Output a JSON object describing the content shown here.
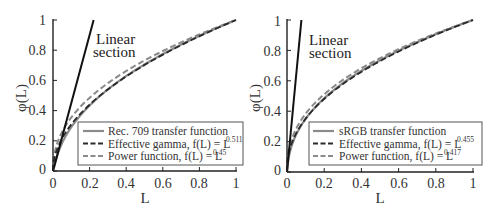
{
  "chart_data": [
    {
      "type": "line",
      "title": "",
      "xlabel": "L",
      "ylabel": "φ(L)",
      "xlim": [
        0,
        1
      ],
      "ylim": [
        0,
        1
      ],
      "xticks": [
        "0",
        "0.2",
        "0.4",
        "0.6",
        "0.8",
        "1"
      ],
      "yticks": [
        "0",
        "0.2",
        "0.4",
        "0.6",
        "0.8",
        "1"
      ],
      "grid": false,
      "legend_position": "lower right",
      "annotation": [
        "Linear",
        "section"
      ],
      "linear_section": {
        "slope": 4.5,
        "x": [
          0,
          0.222
        ],
        "y": [
          0,
          1
        ]
      },
      "series": [
        {
          "name": "Rec. 709 transfer function",
          "style": "solid",
          "color": "#8a8a8a",
          "formula": "L<0.018 ? 4.5L : 1.099*L^0.45 - 0.099",
          "x": [
            0,
            0.018,
            0.05,
            0.1,
            0.2,
            0.3,
            0.4,
            0.5,
            0.6,
            0.7,
            0.8,
            0.9,
            1.0
          ],
          "y": [
            0,
            0.081,
            0.226,
            0.409,
            0.591,
            0.706,
            0.795,
            0.869,
            0.934,
            0.991,
            1.043,
            0.978,
            1.0
          ]
        },
        {
          "name": "Effective gamma, f(L) = L^0.511",
          "label_main": "Effective gamma, f(L) = L",
          "exponent": "0.511",
          "style": "dashed",
          "color": "#222222",
          "x": [
            0,
            0.05,
            0.1,
            0.2,
            0.3,
            0.4,
            0.5,
            0.6,
            0.7,
            0.8,
            0.9,
            1.0
          ],
          "y": [
            0,
            0.216,
            0.308,
            0.44,
            0.54,
            0.626,
            0.702,
            0.77,
            0.833,
            0.892,
            0.948,
            1.0
          ]
        },
        {
          "name": "Power function, f(L) = L^0.45",
          "label_main": "Power function, f(L) = L",
          "exponent": "0.45",
          "style": "dashed",
          "color": "#8a8a8a",
          "x": [
            0,
            0.05,
            0.1,
            0.2,
            0.3,
            0.4,
            0.5,
            0.6,
            0.7,
            0.8,
            0.9,
            1.0
          ],
          "y": [
            0,
            0.26,
            0.355,
            0.485,
            0.582,
            0.662,
            0.732,
            0.795,
            0.852,
            0.904,
            0.954,
            1.0
          ]
        }
      ],
      "legend": [
        {
          "label": "Rec. 709 transfer function",
          "sup": ""
        },
        {
          "label": "Effective gamma, f(L) = L",
          "sup": "0.511"
        },
        {
          "label": "Power function, f(L) = L",
          "sup": "0.45"
        }
      ]
    },
    {
      "type": "line",
      "title": "",
      "xlabel": "L",
      "ylabel": "φ(L)",
      "xlim": [
        0,
        1
      ],
      "ylim": [
        0,
        1
      ],
      "xticks": [
        "0",
        "0.2",
        "0.4",
        "0.6",
        "0.8",
        "1"
      ],
      "yticks": [
        "0",
        "0.2",
        "0.4",
        "0.6",
        "0.8",
        "1"
      ],
      "grid": false,
      "legend_position": "lower right",
      "annotation": [
        "Linear",
        "section"
      ],
      "linear_section": {
        "slope": 12.92,
        "x": [
          0,
          0.0774
        ],
        "y": [
          0,
          1
        ]
      },
      "series": [
        {
          "name": "sRGB transfer function",
          "style": "solid",
          "color": "#8a8a8a",
          "formula": "L<=0.0031308 ? 12.92L : 1.055*L^(1/2.4) - 0.055",
          "x": [
            0,
            0.0031308,
            0.05,
            0.1,
            0.2,
            0.3,
            0.4,
            0.5,
            0.6,
            0.7,
            0.8,
            0.9,
            1.0
          ],
          "y": [
            0,
            0.04,
            0.248,
            0.35,
            0.485,
            0.584,
            0.665,
            0.735,
            0.798,
            0.854,
            0.906,
            0.955,
            1.0
          ]
        },
        {
          "name": "Effective gamma, f(L) = L^0.455",
          "label_main": "Effective gamma, f(L) = L",
          "exponent": "0.455",
          "style": "dashed",
          "color": "#222222",
          "x": [
            0,
            0.05,
            0.1,
            0.2,
            0.3,
            0.4,
            0.5,
            0.6,
            0.7,
            0.8,
            0.9,
            1.0
          ],
          "y": [
            0,
            0.256,
            0.351,
            0.481,
            0.578,
            0.659,
            0.73,
            0.793,
            0.85,
            0.903,
            0.953,
            1.0
          ]
        },
        {
          "name": "Power function, f(L) = L^0.417",
          "label_main": "Power function, f(L) = L",
          "exponent": "0.417",
          "style": "dashed",
          "color": "#8a8a8a",
          "x": [
            0,
            0.05,
            0.1,
            0.2,
            0.3,
            0.4,
            0.5,
            0.6,
            0.7,
            0.8,
            0.9,
            1.0
          ],
          "y": [
            0,
            0.287,
            0.383,
            0.511,
            0.605,
            0.682,
            0.749,
            0.808,
            0.862,
            0.911,
            0.957,
            1.0
          ]
        }
      ],
      "legend": [
        {
          "label": "sRGB transfer function",
          "sup": ""
        },
        {
          "label": "Effective gamma, f(L) = L",
          "sup": "0.455"
        },
        {
          "label": "Power function, f(L) = L",
          "sup": "0.417"
        }
      ]
    }
  ],
  "charts": {
    "left": {
      "ylabel": "φ(L)",
      "xlabel": "L",
      "annotation_line1": "Linear",
      "annotation_line2": "section",
      "ticks": [
        "0",
        "0.2",
        "0.4",
        "0.6",
        "0.8",
        "1"
      ],
      "legend": [
        "Rec. 709 transfer function",
        "Effective gamma, f(L) = L",
        "Power function, f(L) = L"
      ],
      "legend_sup": [
        "",
        "0.511",
        "0.45"
      ]
    },
    "right": {
      "ylabel": "φ(L)",
      "xlabel": "L",
      "annotation_line1": "Linear",
      "annotation_line2": "section",
      "ticks": [
        "0",
        "0.2",
        "0.4",
        "0.6",
        "0.8",
        "1"
      ],
      "legend": [
        "sRGB transfer function",
        "Effective gamma, f(L) = L",
        "Power function, f(L) = L"
      ],
      "legend_sup": [
        "",
        "0.455",
        "0.417"
      ]
    }
  },
  "colors": {
    "axis": "#222222",
    "linear": "#111111",
    "gray_curve": "#8a8a8a",
    "dark_dashed": "#222222"
  }
}
